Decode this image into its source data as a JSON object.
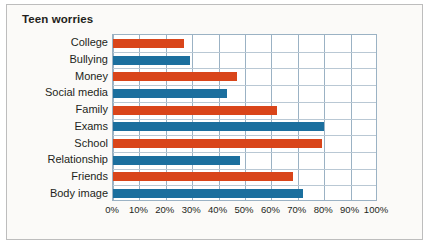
{
  "chart_data": {
    "type": "bar",
    "orientation": "horizontal",
    "title": "Teen worries",
    "xlabel": "",
    "ylabel": "",
    "xlim": [
      0,
      100
    ],
    "x_tick_labels": [
      "0%",
      "10%",
      "20%",
      "30%",
      "40%",
      "50%",
      "60%",
      "70%",
      "80%",
      "90%",
      "100%"
    ],
    "x_tick_values": [
      0,
      10,
      20,
      30,
      40,
      50,
      60,
      70,
      80,
      90,
      100
    ],
    "grid": true,
    "legend": "none",
    "categories": [
      "College",
      "Bullying",
      "Money",
      "Social media",
      "Family",
      "Exams",
      "School",
      "Relationship",
      "Friends",
      "Body image"
    ],
    "values": [
      27,
      29,
      47,
      43,
      62,
      80,
      79,
      48,
      68,
      72
    ],
    "bar_colors": [
      "#d9451a",
      "#1b6f9e",
      "#d9451a",
      "#1b6f9e",
      "#d9451a",
      "#1b6f9e",
      "#d9451a",
      "#1b6f9e",
      "#d9451a",
      "#1b6f9e"
    ],
    "bars": [
      {
        "label": "College",
        "value": 27,
        "color": "#d9451a"
      },
      {
        "label": "Bullying",
        "value": 29,
        "color": "#1b6f9e"
      },
      {
        "label": "Money",
        "value": 47,
        "color": "#d9451a"
      },
      {
        "label": "Social media",
        "value": 43,
        "color": "#1b6f9e"
      },
      {
        "label": "Family",
        "value": 62,
        "color": "#d9451a"
      },
      {
        "label": "Exams",
        "value": 80,
        "color": "#1b6f9e"
      },
      {
        "label": "School",
        "value": 79,
        "color": "#d9451a"
      },
      {
        "label": "Relationship",
        "value": 48,
        "color": "#1b6f9e"
      },
      {
        "label": "Friends",
        "value": 68,
        "color": "#d9451a"
      },
      {
        "label": "Body image",
        "value": 72,
        "color": "#1b6f9e"
      }
    ],
    "colors": {
      "orange": "#d9451a",
      "blue": "#1b6f9e",
      "grid": "#b9c8d4",
      "axis": "#9bb2c4",
      "card_border": "#bdbdbd",
      "card_background": "#fbfaf8",
      "text": "#231f20"
    }
  }
}
